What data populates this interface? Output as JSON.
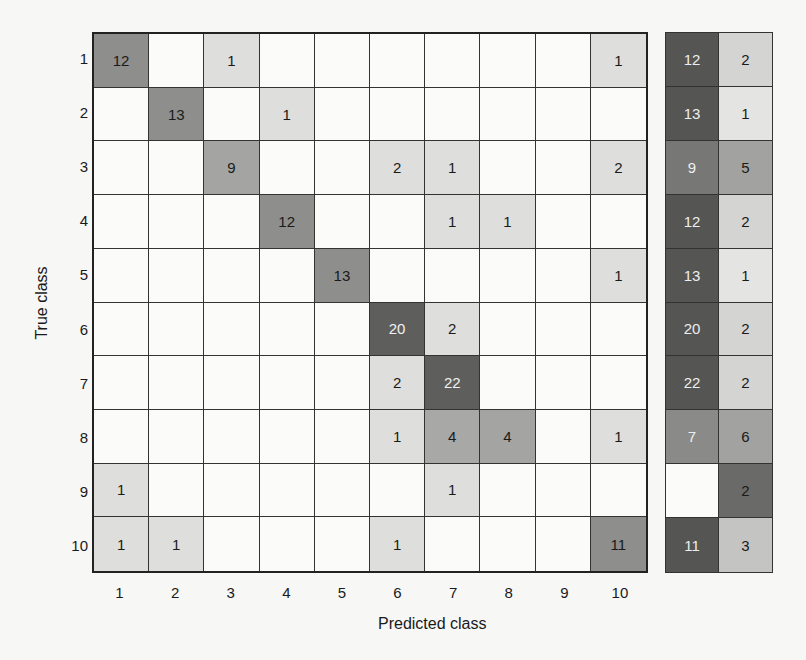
{
  "chart_data": {
    "type": "heatmap",
    "title": "",
    "xlabel": "Predicted class",
    "ylabel": "True class",
    "x_categories": [
      "1",
      "2",
      "3",
      "4",
      "5",
      "6",
      "7",
      "8",
      "9",
      "10"
    ],
    "y_categories": [
      "1",
      "2",
      "3",
      "4",
      "5",
      "6",
      "7",
      "8",
      "9",
      "10"
    ],
    "matrix": [
      [
        12,
        0,
        1,
        0,
        0,
        0,
        0,
        0,
        0,
        1
      ],
      [
        0,
        13,
        0,
        1,
        0,
        0,
        0,
        0,
        0,
        0
      ],
      [
        0,
        0,
        9,
        0,
        0,
        2,
        1,
        0,
        0,
        2
      ],
      [
        0,
        0,
        0,
        12,
        0,
        0,
        1,
        1,
        0,
        0
      ],
      [
        0,
        0,
        0,
        0,
        13,
        0,
        0,
        0,
        0,
        1
      ],
      [
        0,
        0,
        0,
        0,
        0,
        20,
        2,
        0,
        0,
        0
      ],
      [
        0,
        0,
        0,
        0,
        0,
        2,
        22,
        0,
        0,
        0
      ],
      [
        0,
        0,
        0,
        0,
        0,
        1,
        4,
        4,
        0,
        1
      ],
      [
        1,
        0,
        0,
        0,
        0,
        0,
        1,
        0,
        0,
        0
      ],
      [
        1,
        1,
        0,
        0,
        0,
        1,
        0,
        0,
        0,
        11
      ]
    ],
    "summary_columns": {
      "correct": [
        12,
        13,
        9,
        12,
        13,
        20,
        22,
        7,
        null,
        11
      ],
      "incorrect": [
        2,
        1,
        5,
        2,
        1,
        2,
        2,
        6,
        2,
        3
      ]
    },
    "colormap": "grayscale (darker = higher relative count)"
  }
}
